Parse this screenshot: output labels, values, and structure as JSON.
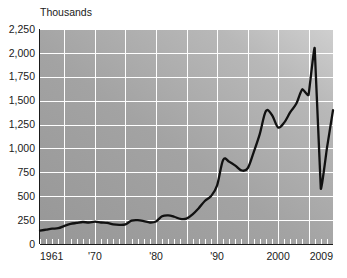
{
  "chart_data": {
    "type": "line",
    "title": "Thousands",
    "xlabel": "",
    "ylabel": "Thousands",
    "grid": true,
    "legend": "none",
    "xlim": [
      1961,
      2009
    ],
    "ylim": [
      0,
      2250
    ],
    "y_ticks": [
      0,
      250,
      500,
      750,
      1000,
      1250,
      1500,
      1750,
      2000,
      2250
    ],
    "y_tick_labels": [
      "0",
      "250",
      "500",
      "750",
      "1,000",
      "1,250",
      "1,500",
      "1,750",
      "2,000",
      "2,250"
    ],
    "x_tick_labels": [
      "1961",
      "'70",
      "'80",
      "'90",
      "2000",
      "2009"
    ],
    "x_tick_values": [
      1961,
      1970,
      1980,
      1990,
      2000,
      2009
    ],
    "x_gridline_years": [
      1965,
      1970,
      1975,
      1980,
      1985,
      1990,
      1995,
      2000,
      2005
    ],
    "x": [
      1961,
      1962,
      1963,
      1964,
      1965,
      1966,
      1967,
      1968,
      1969,
      1970,
      1971,
      1972,
      1973,
      1974,
      1975,
      1976,
      1977,
      1978,
      1979,
      1980,
      1981,
      1982,
      1983,
      1984,
      1985,
      1986,
      1987,
      1988,
      1989,
      1990,
      1991,
      1992,
      1993,
      1994,
      1995,
      1996,
      1997,
      1998,
      1999,
      2000,
      2001,
      2002,
      2003,
      2004,
      2005,
      2006,
      2007,
      2008,
      2009
    ],
    "values": [
      140,
      150,
      160,
      165,
      190,
      210,
      220,
      230,
      225,
      235,
      225,
      220,
      205,
      200,
      205,
      245,
      250,
      240,
      225,
      235,
      290,
      300,
      285,
      262,
      265,
      310,
      375,
      450,
      500,
      610,
      880,
      860,
      820,
      770,
      790,
      960,
      1150,
      1390,
      1350,
      1220,
      1270,
      1380,
      1470,
      1620,
      1560,
      2050,
      580,
      1000,
      1400
    ],
    "series": [
      {
        "name": "value",
        "values": [
          140,
          150,
          160,
          165,
          190,
          210,
          220,
          230,
          225,
          235,
          225,
          220,
          205,
          200,
          205,
          245,
          250,
          240,
          225,
          235,
          290,
          300,
          285,
          262,
          265,
          310,
          375,
          450,
          500,
          610,
          880,
          860,
          820,
          770,
          790,
          960,
          1150,
          1390,
          1350,
          1220,
          1270,
          1380,
          1470,
          1620,
          1560,
          2050,
          580,
          1000,
          1400
        ]
      }
    ],
    "colors": {
      "line": "#111111",
      "grid": "#ffffff",
      "plot_background_dark": "#9a9a9a",
      "plot_background_light": "#c8c8c8",
      "text": "#1a1a1a"
    }
  }
}
